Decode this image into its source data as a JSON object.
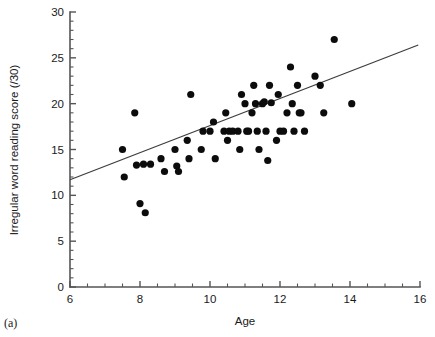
{
  "figure": {
    "panel_label": "(a)",
    "background": "#ffffff",
    "point_color": "#0c0c0c",
    "line_color": "#3d3d3d",
    "axis_color": "#555555"
  },
  "chart_data": {
    "type": "scatter",
    "title": "",
    "xlabel": "Age",
    "ylabel": "Irregular word reading score (/30)",
    "xlim": [
      6,
      16
    ],
    "ylim": [
      0,
      30
    ],
    "xticks": [
      6,
      8,
      10,
      12,
      14,
      16
    ],
    "yticks": [
      0,
      5,
      10,
      15,
      20,
      25,
      30
    ],
    "xtick_labels": [
      "6",
      "8",
      "10",
      "12",
      "14",
      "16"
    ],
    "ytick_labels": [
      "0",
      "5",
      "10",
      "15",
      "20",
      "25",
      "30"
    ],
    "x_minor_tick_step": 0.5,
    "y_minor_tick_step": 1,
    "grid": false,
    "legend": false,
    "point_marker": "filled-circle",
    "point_radius_px": 3.6,
    "points": [
      [
        7.5,
        15.0
      ],
      [
        7.55,
        12.0
      ],
      [
        7.85,
        19.0
      ],
      [
        7.9,
        13.3
      ],
      [
        8.0,
        9.1
      ],
      [
        8.1,
        13.4
      ],
      [
        8.15,
        8.1
      ],
      [
        8.3,
        13.4
      ],
      [
        8.6,
        14.0
      ],
      [
        8.7,
        12.6
      ],
      [
        9.0,
        15.0
      ],
      [
        9.05,
        13.2
      ],
      [
        9.1,
        12.6
      ],
      [
        9.35,
        16.0
      ],
      [
        9.4,
        14.0
      ],
      [
        9.45,
        21.0
      ],
      [
        9.75,
        15.0
      ],
      [
        9.8,
        17.0
      ],
      [
        10.0,
        17.0
      ],
      [
        10.1,
        18.0
      ],
      [
        10.15,
        14.0
      ],
      [
        10.4,
        17.0
      ],
      [
        10.45,
        19.0
      ],
      [
        10.5,
        16.0
      ],
      [
        10.55,
        17.0
      ],
      [
        10.65,
        17.0
      ],
      [
        10.8,
        17.0
      ],
      [
        10.85,
        15.0
      ],
      [
        10.9,
        21.0
      ],
      [
        11.0,
        20.0
      ],
      [
        11.05,
        17.0
      ],
      [
        11.1,
        17.0
      ],
      [
        11.2,
        19.0
      ],
      [
        11.25,
        22.0
      ],
      [
        11.3,
        20.0
      ],
      [
        11.35,
        17.0
      ],
      [
        11.4,
        15.0
      ],
      [
        11.5,
        20.0
      ],
      [
        11.55,
        20.2
      ],
      [
        11.6,
        17.0
      ],
      [
        11.65,
        13.8
      ],
      [
        11.7,
        22.0
      ],
      [
        11.75,
        20.1
      ],
      [
        11.9,
        16.0
      ],
      [
        11.95,
        21.0
      ],
      [
        12.0,
        17.0
      ],
      [
        12.1,
        17.0
      ],
      [
        12.2,
        19.0
      ],
      [
        12.3,
        24.0
      ],
      [
        12.35,
        20.0
      ],
      [
        12.4,
        17.0
      ],
      [
        12.5,
        22.0
      ],
      [
        12.55,
        19.0
      ],
      [
        12.6,
        19.0
      ],
      [
        12.7,
        17.0
      ],
      [
        13.0,
        23.0
      ],
      [
        13.15,
        22.0
      ],
      [
        13.25,
        19.0
      ],
      [
        13.55,
        27.0
      ],
      [
        14.05,
        20.0
      ]
    ],
    "fit_line": {
      "type": "linear-regression",
      "x_start": 6.0,
      "y_start": 11.7,
      "x_end": 15.95,
      "y_end": 26.4
    }
  }
}
